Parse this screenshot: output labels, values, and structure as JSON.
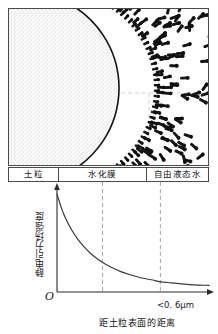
{
  "figure": {
    "kind": "soil-water-electrostatic-field-schematic",
    "diagram": {
      "zones": [
        {
          "id": "soil-particle",
          "label": "土粒"
        },
        {
          "id": "hydration-film",
          "label": "水化膜"
        },
        {
          "id": "free-liquid-water",
          "label": "自由液态水"
        }
      ],
      "particle": {
        "fill_pattern": "stipple",
        "outline_color": "#111111"
      },
      "dipole_color": "#111111",
      "guide_line_color": "#b0b0b0",
      "frame_color": "#4a4a4a"
    }
  },
  "chart_data": {
    "type": "line",
    "title": "",
    "xlabel": "距土粒表面的距离",
    "ylabel": "静电引力场强度",
    "origin_label": "O",
    "annotations": [
      {
        "id": "x-extent",
        "text": "<0. 6μm",
        "position": "x-axis-right-end"
      }
    ],
    "grid": false,
    "legend": null,
    "axis_arrows": {
      "x": true,
      "y": true
    },
    "xlim": [
      0,
      1
    ],
    "ylim": [
      0,
      1
    ],
    "tick_labels": {
      "x": [],
      "y": []
    },
    "reference_lines": [
      {
        "id": "hydration-film-boundary",
        "x": 0.3,
        "style": "dashed",
        "color": "#9a9a9a"
      },
      {
        "id": "free-water-boundary",
        "x": 0.68,
        "style": "dashed",
        "color": "#9a9a9a"
      }
    ],
    "series": [
      {
        "name": "静电引力场强度",
        "color": "#3a3a3a",
        "x": [
          0.0,
          0.03,
          0.06,
          0.1,
          0.14,
          0.18,
          0.22,
          0.26,
          0.3,
          0.36,
          0.42,
          0.48,
          0.55,
          0.62,
          0.68,
          0.75,
          0.82,
          0.9,
          1.0
        ],
        "y": [
          0.96,
          0.82,
          0.71,
          0.6,
          0.51,
          0.44,
          0.38,
          0.33,
          0.29,
          0.24,
          0.2,
          0.17,
          0.14,
          0.12,
          0.1,
          0.09,
          0.08,
          0.07,
          0.065
        ]
      }
    ]
  }
}
